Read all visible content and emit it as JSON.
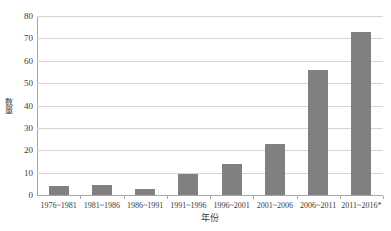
{
  "chart_data": {
    "type": "bar",
    "title": "",
    "xlabel": "年份",
    "ylabel": "数量",
    "categories": [
      "1976~1981",
      "1981~1986",
      "1986~1991",
      "1991~1996",
      "1996~2001",
      "2001~2006",
      "2006~2011",
      "2011~2016*"
    ],
    "values": [
      4,
      4.5,
      2.5,
      9.5,
      14,
      23,
      56,
      73
    ],
    "ylim": [
      0,
      80
    ],
    "ytick_labels": [
      "0",
      "10",
      "20",
      "30",
      "40",
      "50",
      "60",
      "70",
      "80"
    ],
    "ytick_values": [
      0,
      10,
      20,
      30,
      40,
      50,
      60,
      70,
      80
    ],
    "ytick_interval": 10,
    "grid": "horizontal",
    "legend": "none",
    "bar_color": "#808080",
    "gridline_color": "#d4d4d4",
    "axis_color": "#a6a6a6",
    "background_color": "#ffffff",
    "series": [
      {
        "name": "数量",
        "values": [
          4,
          4.5,
          2.5,
          9.5,
          14,
          23,
          56,
          73
        ]
      }
    ]
  }
}
